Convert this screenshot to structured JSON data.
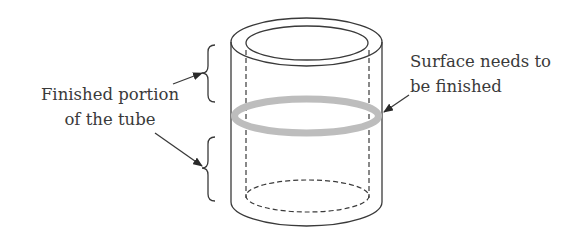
{
  "diagram": {
    "labels": {
      "left_line1": "Finished portion",
      "left_line2": "of the tube",
      "right_line1": "Surface needs to",
      "right_line2": "be finished"
    },
    "colors": {
      "line": "#3a3a3a",
      "highlight_ring": "#bdbdbd",
      "background": "#ffffff"
    },
    "elements": [
      "outer-cylinder",
      "inner-bore-dashed",
      "surface-band-ring",
      "upper-brace",
      "lower-brace",
      "arrows"
    ]
  }
}
